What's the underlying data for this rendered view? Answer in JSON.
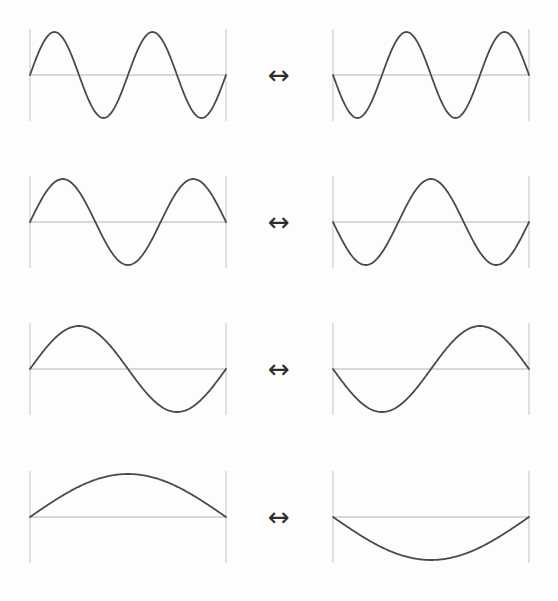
{
  "figure": {
    "arrow_glyph": "↔",
    "colors": {
      "background": "#fdfdfd",
      "curve": "#4a4a4a",
      "axis": "#b4b4b4",
      "boundary": "#c4c4c4",
      "arrow": "#2e2e2e"
    },
    "rows": [
      {
        "mode": 4,
        "half_wavelengths": 4,
        "left_sign": 1,
        "right_sign": -1
      },
      {
        "mode": 3,
        "half_wavelengths": 3,
        "left_sign": 1,
        "right_sign": -1
      },
      {
        "mode": 2,
        "half_wavelengths": 2,
        "left_sign": 1,
        "right_sign": -1
      },
      {
        "mode": 1,
        "half_wavelengths": 1,
        "left_sign": 1,
        "right_sign": -1
      }
    ]
  },
  "layout": {
    "left_x": 30,
    "right_x": 333,
    "panel_width": 196,
    "amplitude": 43,
    "boundary_half_height": 46,
    "row_axis_y": [
      75,
      222,
      369,
      517
    ],
    "arrow_x": 259
  }
}
